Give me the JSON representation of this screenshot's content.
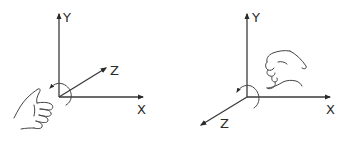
{
  "diagrams": [
    {
      "name": "left-handed-coordinate-system",
      "axes": {
        "y_label": "Y",
        "x_label": "X",
        "z_label": "Z"
      },
      "z_direction": "into-screen (upper-right)",
      "hand": "left thumb-up fist",
      "rotation_arrow": "counter-clockwise"
    },
    {
      "name": "right-handed-coordinate-system",
      "axes": {
        "y_label": "Y",
        "x_label": "X",
        "z_label": "Z"
      },
      "z_direction": "out-of-screen (lower-left)",
      "hand": "right curled hand",
      "rotation_arrow": "counter-clockwise"
    }
  ],
  "colors": {
    "stroke": "#3a3a3a",
    "background": "#ffffff"
  }
}
